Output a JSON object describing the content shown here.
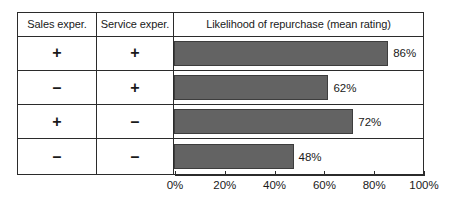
{
  "figure": {
    "background_color": "#ffffff",
    "bar_color": "#636363",
    "border_color": "#2b2b2b"
  },
  "table": {
    "headers": [
      "Sales exper.",
      "Service exper.",
      "Likelihood of repurchase (mean rating)"
    ],
    "rows": [
      {
        "sales": "+",
        "service": "+",
        "value_label": "86%"
      },
      {
        "sales": "–",
        "service": "+",
        "value_label": "62%"
      },
      {
        "sales": "+",
        "service": "–",
        "value_label": "72%"
      },
      {
        "sales": "–",
        "service": "–",
        "value_label": "48%"
      }
    ]
  },
  "axis": {
    "ticks": [
      "0%",
      "20%",
      "40%",
      "60%",
      "80%",
      "100%"
    ]
  },
  "chart_data": {
    "type": "bar",
    "orientation": "horizontal",
    "title": "Likelihood of repurchase (mean rating)",
    "xlabel": "",
    "ylabel": "",
    "xlim": [
      0,
      100
    ],
    "grid": false,
    "legend": "none",
    "categories": [
      "+ / +",
      "– / +",
      "+ / –",
      "– / –"
    ],
    "category_fields": [
      "Sales exper.",
      "Service exper."
    ],
    "category_values": [
      [
        "+",
        "+"
      ],
      [
        "–",
        "+"
      ],
      [
        "+",
        "–"
      ],
      [
        "–",
        "–"
      ]
    ],
    "values": [
      86,
      62,
      72,
      48
    ],
    "data_labels": [
      "86%",
      "62%",
      "72%",
      "48%"
    ],
    "xticks": [
      0,
      20,
      40,
      60,
      80,
      100
    ],
    "xticklabels": [
      "0%",
      "20%",
      "40%",
      "60%",
      "80%",
      "100%"
    ],
    "units": "percent"
  }
}
